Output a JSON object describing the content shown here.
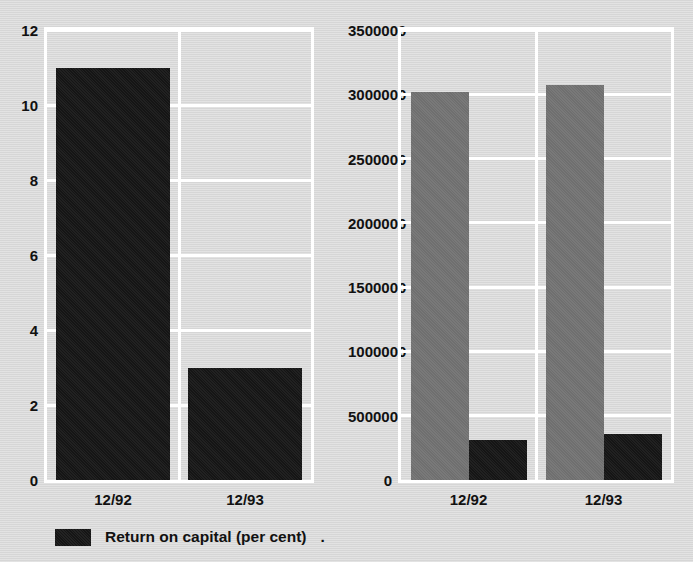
{
  "chart_data": [
    {
      "type": "bar",
      "title": "",
      "xlabel": "",
      "ylabel": "",
      "categories": [
        "12/92",
        "12/93"
      ],
      "series": [
        {
          "name": "Return on capital (per cent)",
          "color": "#151515",
          "values": [
            11,
            3
          ]
        }
      ],
      "yticks": [
        0,
        2,
        4,
        6,
        8,
        10,
        12
      ],
      "ytick_labels": [
        "0",
        "2",
        "4",
        "6",
        "8",
        "10",
        "12"
      ],
      "ylim": [
        0,
        12
      ],
      "grid": true,
      "legend_position": "bottom",
      "legend": [
        {
          "label": "Return on capital (per cent)",
          "swatch": "dark"
        }
      ],
      "legend_trailer": "."
    },
    {
      "type": "bar",
      "title": "",
      "xlabel": "",
      "ylabel": "",
      "categories": [
        "12/92",
        "12/93"
      ],
      "series": [
        {
          "name": "Sales revenue",
          "color": "#6f6f6f",
          "values": [
            3020000,
            3070000
          ]
        },
        {
          "name": "Profit before tax  (£000s)",
          "color": "#151515",
          "values": [
            315000,
            360000
          ]
        }
      ],
      "yticks": [
        0,
        500000,
        1000000,
        1500000,
        2000000,
        2500000,
        3000000,
        3500000
      ],
      "ytick_labels": [
        "0",
        "500000",
        "1000000",
        "1500000",
        "2000000",
        "2500000",
        "3000000",
        "3500000"
      ],
      "ylim": [
        0,
        3500000
      ],
      "grid": true,
      "legend_position": "bottom",
      "legend": [
        {
          "label": "Sales revenue",
          "swatch": "gray"
        },
        {
          "label": "Profit before tax  (£000s)",
          "swatch": "dark"
        }
      ],
      "legend_trailer": ""
    }
  ],
  "colors": {
    "background": "#d9d9d9",
    "gridline": "#ffffff",
    "bar_dark": "#151515",
    "bar_gray": "#6f6f6f",
    "text": "#111111"
  }
}
